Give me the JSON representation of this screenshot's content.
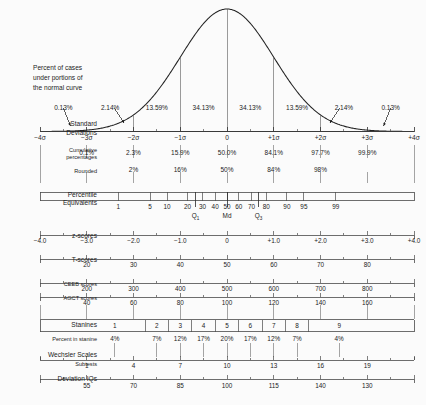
{
  "chart_data": {
    "type": "line",
    "xlabel": "Standard Deviations",
    "ylabel": "",
    "xlim": [
      -4,
      4
    ],
    "grid": false,
    "legend": null,
    "curve": {
      "name": "normal distribution",
      "description": "standard normal probability density curve",
      "mean": 0,
      "sd": 1
    },
    "band_percents": {
      "label": "Percent of cases under portions of the normal curve",
      "bands": [
        {
          "from": -4,
          "to": -3,
          "value": "0.13%"
        },
        {
          "from": -3,
          "to": -2,
          "value": "2.14%"
        },
        {
          "from": -2,
          "to": -1,
          "value": "13.59%"
        },
        {
          "from": -1,
          "to": 0,
          "value": "34.13%"
        },
        {
          "from": 0,
          "to": 1,
          "value": "34.13%"
        },
        {
          "from": 1,
          "to": 2,
          "value": "13.59%"
        },
        {
          "from": 2,
          "to": 3,
          "value": "2.14%"
        },
        {
          "from": 3,
          "to": 4,
          "value": "0.13%"
        }
      ]
    },
    "scales": [
      {
        "id": "standard-deviations",
        "label": "Standard Deviations",
        "ticks": [
          {
            "sigma": -4,
            "text": "−4σ"
          },
          {
            "sigma": -3,
            "text": "−3σ"
          },
          {
            "sigma": -2,
            "text": "−2σ"
          },
          {
            "sigma": -1,
            "text": "−1σ"
          },
          {
            "sigma": 0,
            "text": "0"
          },
          {
            "sigma": 1,
            "text": "+1σ"
          },
          {
            "sigma": 2,
            "text": "+2σ"
          },
          {
            "sigma": 3,
            "text": "+3σ"
          },
          {
            "sigma": 4,
            "text": "+4σ"
          }
        ]
      },
      {
        "id": "cumulative-percentages",
        "label": "Cumulative percentages",
        "ticks": [
          {
            "sigma": -3,
            "text": "0.1%"
          },
          {
            "sigma": -2,
            "text": "2.3%"
          },
          {
            "sigma": -1,
            "text": "15.9%"
          },
          {
            "sigma": 0,
            "text": "50.0%"
          },
          {
            "sigma": 1,
            "text": "84.1%"
          },
          {
            "sigma": 2,
            "text": "97.7%"
          },
          {
            "sigma": 3,
            "text": "99.9%"
          }
        ]
      },
      {
        "id": "rounded",
        "label": "Rounded",
        "ticks": [
          {
            "sigma": -2,
            "text": "2%"
          },
          {
            "sigma": -1,
            "text": "16%"
          },
          {
            "sigma": 0,
            "text": "50%"
          },
          {
            "sigma": 1,
            "text": "84%"
          },
          {
            "sigma": 2,
            "text": "98%"
          }
        ]
      },
      {
        "id": "percentile-equivalents",
        "label": "Percentile Equivalents",
        "ticks": [
          {
            "sigma": -2.326,
            "text": "1"
          },
          {
            "sigma": -1.645,
            "text": "5"
          },
          {
            "sigma": -1.282,
            "text": "10"
          },
          {
            "sigma": -0.842,
            "text": "20"
          },
          {
            "sigma": -0.524,
            "text": "30"
          },
          {
            "sigma": -0.253,
            "text": "40"
          },
          {
            "sigma": 0.0,
            "text": "50"
          },
          {
            "sigma": 0.253,
            "text": "60"
          },
          {
            "sigma": 0.524,
            "text": "70"
          },
          {
            "sigma": 0.842,
            "text": "80"
          },
          {
            "sigma": 1.282,
            "text": "90"
          },
          {
            "sigma": 1.645,
            "text": "95"
          },
          {
            "sigma": 2.326,
            "text": "99"
          }
        ],
        "quartiles": [
          {
            "sigma": -0.674,
            "text": "Q",
            "subscript": "1"
          },
          {
            "sigma": 0.0,
            "text": "Md",
            "subscript": ""
          },
          {
            "sigma": 0.674,
            "text": "Q",
            "subscript": "3"
          }
        ]
      },
      {
        "id": "z-scores",
        "label": "z-scores",
        "ticks": [
          {
            "sigma": -4,
            "text": "−4.0"
          },
          {
            "sigma": -3,
            "text": "−3.0"
          },
          {
            "sigma": -2,
            "text": "−2.0"
          },
          {
            "sigma": -1,
            "text": "−1.0"
          },
          {
            "sigma": 0,
            "text": "0"
          },
          {
            "sigma": 1,
            "text": "+1.0"
          },
          {
            "sigma": 2,
            "text": "+2.0"
          },
          {
            "sigma": 3,
            "text": "+3.0"
          },
          {
            "sigma": 4,
            "text": "+4.0"
          }
        ]
      },
      {
        "id": "t-scores",
        "label": "T-scores",
        "ticks": [
          {
            "sigma": -3,
            "text": "20"
          },
          {
            "sigma": -2,
            "text": "30"
          },
          {
            "sigma": -1,
            "text": "40"
          },
          {
            "sigma": 0,
            "text": "50"
          },
          {
            "sigma": 1,
            "text": "60"
          },
          {
            "sigma": 2,
            "text": "70"
          },
          {
            "sigma": 3,
            "text": "80"
          }
        ]
      },
      {
        "id": "ceeb-scores",
        "label": "CEEB scores",
        "ticks": [
          {
            "sigma": -3,
            "text": "200"
          },
          {
            "sigma": -2,
            "text": "300"
          },
          {
            "sigma": -1,
            "text": "400"
          },
          {
            "sigma": 0,
            "text": "500"
          },
          {
            "sigma": 1,
            "text": "600"
          },
          {
            "sigma": 2,
            "text": "700"
          },
          {
            "sigma": 3,
            "text": "800"
          }
        ]
      },
      {
        "id": "agct-scores",
        "label": "AGCT scores",
        "ticks": [
          {
            "sigma": -3,
            "text": "40"
          },
          {
            "sigma": -2,
            "text": "60"
          },
          {
            "sigma": -1,
            "text": "80"
          },
          {
            "sigma": 0,
            "text": "100"
          },
          {
            "sigma": 1,
            "text": "120"
          },
          {
            "sigma": 2,
            "text": "140"
          },
          {
            "sigma": 3,
            "text": "160"
          }
        ]
      },
      {
        "id": "wechsler-subtests",
        "label": "Wechsler Scales",
        "sublabel": "Subtests",
        "ticks": [
          {
            "sigma": -3,
            "text": "1"
          },
          {
            "sigma": -2,
            "text": "4"
          },
          {
            "sigma": -1,
            "text": "7"
          },
          {
            "sigma": 0,
            "text": "10"
          },
          {
            "sigma": 1,
            "text": "13"
          },
          {
            "sigma": 2,
            "text": "16"
          },
          {
            "sigma": 3,
            "text": "19"
          }
        ]
      },
      {
        "id": "deviation-iqs",
        "label": "Deviation IQs",
        "ticks": [
          {
            "sigma": -3,
            "text": "55"
          },
          {
            "sigma": -2,
            "text": "70"
          },
          {
            "sigma": -1,
            "text": "85"
          },
          {
            "sigma": 0,
            "text": "100"
          },
          {
            "sigma": 1,
            "text": "115"
          },
          {
            "sigma": 2,
            "text": "140"
          },
          {
            "sigma": 3,
            "text": "130"
          }
        ]
      }
    ],
    "stanines": {
      "label": "Stanines",
      "percent_label": "Percent in stanine",
      "cells": [
        {
          "name": "1",
          "percent": "4%",
          "from": -4.0,
          "to": -1.75,
          "center": -2.4
        },
        {
          "name": "2",
          "percent": "7%",
          "from": -1.75,
          "to": -1.25,
          "center": -1.5
        },
        {
          "name": "3",
          "percent": "12%",
          "from": -1.25,
          "to": -0.75,
          "center": -1.0
        },
        {
          "name": "4",
          "percent": "17%",
          "from": -0.75,
          "to": -0.25,
          "center": -0.5
        },
        {
          "name": "5",
          "percent": "20%",
          "from": -0.25,
          "to": 0.25,
          "center": 0.0
        },
        {
          "name": "6",
          "percent": "17%",
          "from": 0.25,
          "to": 0.75,
          "center": 0.5
        },
        {
          "name": "7",
          "percent": "12%",
          "from": 0.75,
          "to": 1.25,
          "center": 1.0
        },
        {
          "name": "8",
          "percent": "7%",
          "from": 1.25,
          "to": 1.75,
          "center": 1.5
        },
        {
          "name": "9",
          "percent": "4%",
          "from": 1.75,
          "to": 4.0,
          "center": 2.4
        }
      ]
    },
    "annotation": {
      "lines": [
        "Percent of cases",
        "under portions of",
        "the normal curve"
      ]
    },
    "colors": {
      "background": "#fbfbfb",
      "ink": "#1c1c1c",
      "rule": "#4a4a4a",
      "curve": "#222222"
    }
  }
}
